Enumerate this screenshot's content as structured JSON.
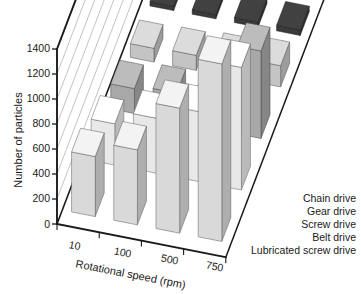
{
  "chart_data": {
    "type": "bar",
    "title": "",
    "subtitle": "",
    "xlabel": "Rotational speed (rpm)",
    "ylabel": "Number of particles",
    "zlabel": "",
    "categories": [
      "10",
      "100",
      "500",
      "750"
    ],
    "ylim": [
      0,
      1400
    ],
    "yticks": [
      0,
      200,
      400,
      600,
      800,
      1000,
      1200,
      1400
    ],
    "ytick_labels": [
      "0",
      "200",
      "400",
      "600",
      "800",
      "1000",
      "1200",
      "1400"
    ],
    "grid": true,
    "legend_position": "right-depth-axis",
    "projection": "3d",
    "series": [
      {
        "name": "Chain drive",
        "values": [
          480,
          600,
          1000,
          1420
        ],
        "color": "#d9d9d9"
      },
      {
        "name": "Gear drive",
        "values": [
          330,
          440,
          560,
          980
        ],
        "color": "#e8e8e8"
      },
      {
        "name": "Screw drive",
        "values": [
          200,
          230,
          260,
          700
        ],
        "color": "#a8a8a8"
      },
      {
        "name": "Belt drive",
        "values": [
          110,
          120,
          140,
          170
        ],
        "color": "#c4c4c4"
      },
      {
        "name": "Lubricated screw drive",
        "values": [
          35,
          35,
          40,
          45
        ],
        "color": "#3a3a3a"
      }
    ]
  },
  "axes": {
    "y_tick_labels": [
      "1400",
      "1200",
      "1000",
      "800",
      "600",
      "400",
      "200",
      "0"
    ],
    "x_tick_labels": [
      "10",
      "100",
      "500",
      "750"
    ],
    "y_axis_title": "Number of particles",
    "x_axis_title": "Rotational speed (rpm)"
  },
  "legend": {
    "items": [
      {
        "label": "Chain drive"
      },
      {
        "label": "Gear drive"
      },
      {
        "label": "Screw drive"
      },
      {
        "label": "Belt drive"
      },
      {
        "label": "Lubricated screw drive"
      }
    ]
  },
  "colors": {
    "axis": "#1a1a1a",
    "grid": "#9a9a9a",
    "background": "#ffffff",
    "bar_top_tint": "#f2f2f2",
    "bar_side_shade": "#8f8f8f"
  }
}
